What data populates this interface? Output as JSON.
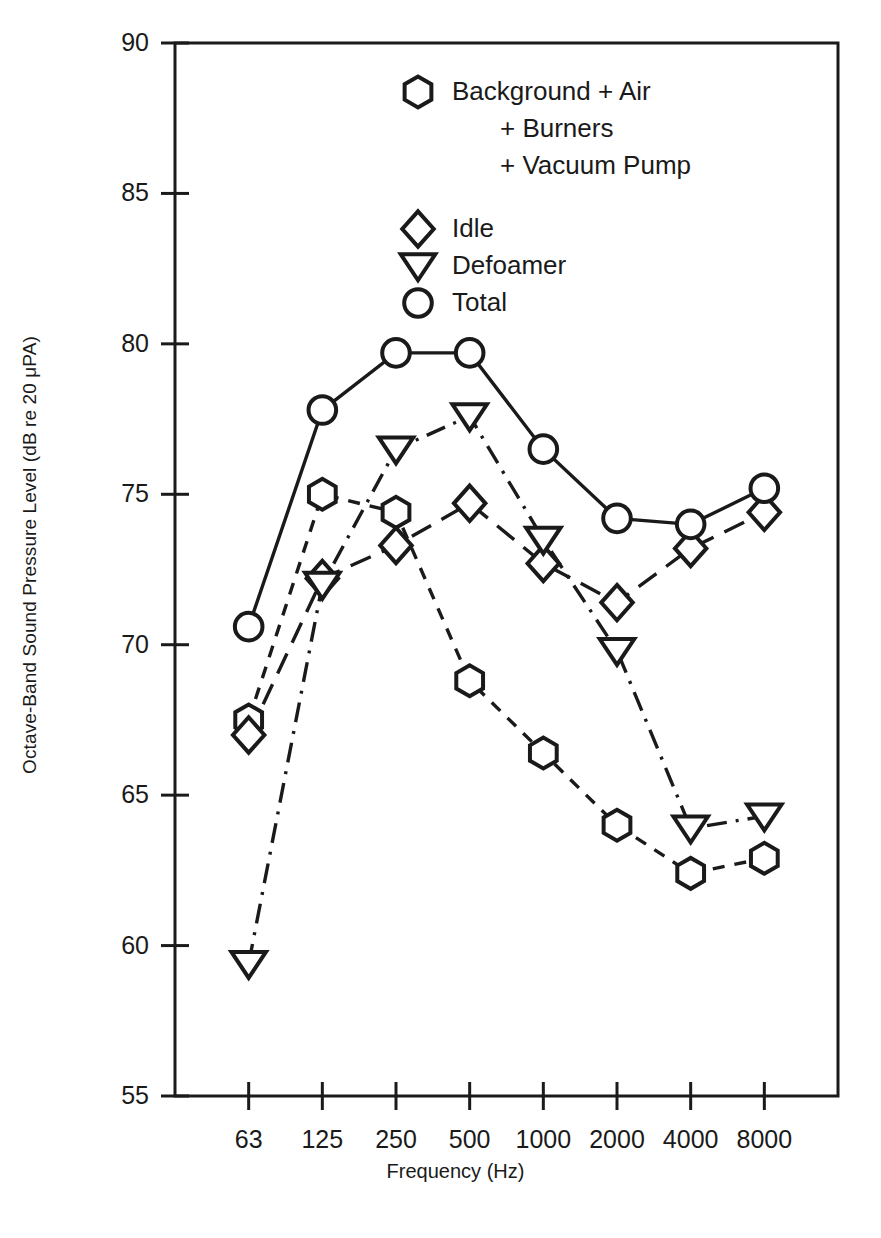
{
  "chart_data": {
    "type": "line",
    "title": "",
    "xlabel": "Frequency (Hz)",
    "ylabel": "Octave-Band Sound Pressure Level (dB re 20 μPA)",
    "categories": [
      "63",
      "125",
      "250",
      "500",
      "1000",
      "2000",
      "4000",
      "8000"
    ],
    "xtick_labels": [
      "63",
      "125",
      "250",
      "500",
      "1000",
      "2000",
      "4000",
      "8000"
    ],
    "ytick_labels": [
      "90",
      "85",
      "80",
      "75",
      "70",
      "65",
      "60",
      "55"
    ],
    "ylim": [
      55,
      90
    ],
    "ytick_step": 5,
    "grid": false,
    "legend_position": "upper-center-inside",
    "series": [
      {
        "name": "Background + Air + Burners + Vacuum Pump",
        "legend_lines": [
          "Background + Air",
          "+ Burners",
          "+ Vacuum Pump"
        ],
        "marker": "hexagon",
        "line_style": "dashed",
        "values": [
          67.5,
          75.0,
          74.4,
          68.8,
          66.4,
          64.0,
          62.4,
          62.9
        ]
      },
      {
        "name": "Idle",
        "legend_lines": [
          "Idle"
        ],
        "marker": "diamond",
        "line_style": "long-dash",
        "values": [
          67.0,
          72.2,
          73.3,
          74.7,
          72.7,
          71.4,
          73.2,
          74.4
        ]
      },
      {
        "name": "Defoamer",
        "legend_lines": [
          "Defoamer"
        ],
        "marker": "triangle-down",
        "line_style": "dash-dot",
        "values": [
          59.4,
          72.0,
          76.5,
          77.6,
          73.5,
          69.8,
          63.9,
          64.3
        ]
      },
      {
        "name": "Total",
        "legend_lines": [
          "Total"
        ],
        "marker": "circle",
        "line_style": "solid",
        "values": [
          70.6,
          77.8,
          79.7,
          79.7,
          76.5,
          74.2,
          74.0,
          75.2
        ]
      }
    ]
  },
  "colors": {
    "ink": "#1a1a1a",
    "background": "#ffffff"
  }
}
